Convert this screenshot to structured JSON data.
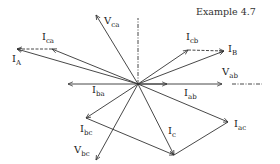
{
  "title": "Example 4.7",
  "origin": {
    "x": 138,
    "y": 84
  },
  "colors": {
    "line": "#333333",
    "text": "#222222",
    "background": "#ffffff"
  },
  "vectors": [
    {
      "id": "V_ca",
      "main": "V",
      "sub": "ca",
      "tip": [
        96,
        15
      ],
      "label_pos": [
        104,
        24
      ],
      "style": "solid"
    },
    {
      "id": "I_ca",
      "main": "I",
      "sub": "ca",
      "tip": [
        52,
        49
      ],
      "label_pos": [
        42,
        40
      ],
      "style": "solid"
    },
    {
      "id": "I_A",
      "main": "I",
      "sub": "A",
      "tip": [
        17,
        49
      ],
      "label_pos": [
        12,
        62
      ],
      "style": "solid"
    },
    {
      "id": "I_cb",
      "main": "I",
      "sub": "cb",
      "tip": [
        188,
        50
      ],
      "label_pos": [
        186,
        40
      ],
      "style": "solid"
    },
    {
      "id": "I_B",
      "main": "I",
      "sub": "B",
      "tip": [
        224,
        51
      ],
      "label_pos": [
        228,
        52
      ],
      "style": "solid"
    },
    {
      "id": "I_ab",
      "main": "I",
      "sub": "ab",
      "tip": [
        167,
        84
      ],
      "label_pos": [
        184,
        96
      ],
      "style": "solid"
    },
    {
      "id": "V_ab",
      "main": "V",
      "sub": "ab",
      "tip": [
        222,
        84
      ],
      "label_pos": [
        222,
        75
      ],
      "style": "solid"
    },
    {
      "id": "I_ba",
      "main": "I",
      "sub": "ba",
      "tip": [
        68,
        84
      ],
      "label_pos": [
        92,
        93
      ],
      "style": "solid"
    },
    {
      "id": "I_ac",
      "main": "I",
      "sub": "ac",
      "tip": [
        228,
        122
      ],
      "label_pos": [
        234,
        127
      ],
      "style": "solid"
    },
    {
      "id": "I_c",
      "main": "I",
      "sub": "c",
      "tip": [
        174,
        155
      ],
      "label_pos": [
        168,
        134
      ],
      "style": "solid"
    },
    {
      "id": "I_bc",
      "main": "I",
      "sub": "bc",
      "tip": [
        86,
        118
      ],
      "label_pos": [
        80,
        132
      ],
      "style": "solid"
    },
    {
      "id": "V_bc",
      "main": "V",
      "sub": "bc",
      "tip": [
        96,
        160
      ],
      "label_pos": [
        74,
        153
      ],
      "style": "solid"
    }
  ],
  "construction_lines": [
    {
      "from": [
        52,
        49
      ],
      "to": [
        17,
        49
      ],
      "style": "dashed",
      "arrow": true
    },
    {
      "from": [
        188,
        50
      ],
      "to": [
        224,
        51
      ],
      "style": "dashed",
      "arrow": true
    },
    {
      "from": [
        232,
        84
      ],
      "to": [
        262,
        84
      ],
      "style": "dashdot",
      "arrow": false
    },
    {
      "from": [
        138,
        84
      ],
      "to": [
        138,
        18
      ],
      "style": "dashdot",
      "arrow": false
    },
    {
      "from": [
        86,
        118
      ],
      "to": [
        174,
        155
      ],
      "style": "solid",
      "arrow": true
    },
    {
      "from": [
        228,
        122
      ],
      "to": [
        174,
        155
      ],
      "style": "solid",
      "arrow": false
    }
  ]
}
